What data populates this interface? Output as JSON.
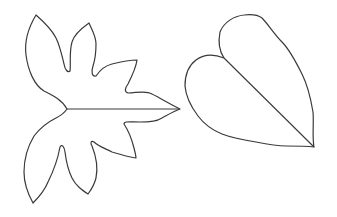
{
  "figure": {
    "items": [
      {
        "name": "palmately-lobed-leaf",
        "label": ""
      },
      {
        "name": "heart-shaped-leaf",
        "label": ""
      }
    ],
    "colors": {
      "background": "#ffffff",
      "stroke": "#3a3a3a"
    }
  }
}
